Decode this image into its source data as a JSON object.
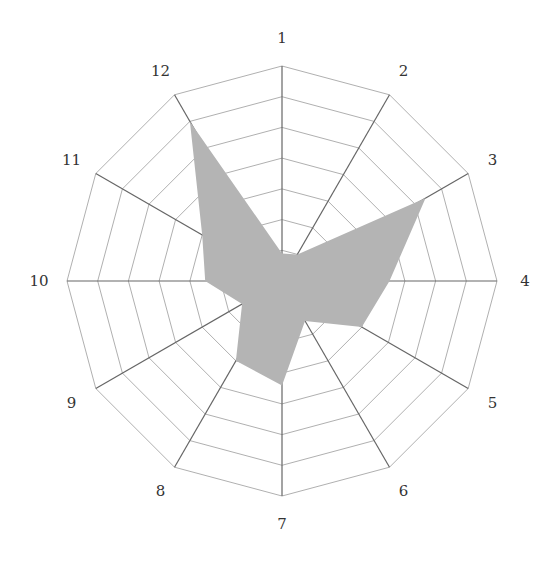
{
  "chart_data": {
    "type": "radar",
    "title": "",
    "categories": [
      "1",
      "2",
      "3",
      "4",
      "5",
      "6",
      "7",
      "8",
      "9",
      "10",
      "11",
      "12"
    ],
    "series": [
      {
        "name": "",
        "values": [
          0.9,
          1.0,
          5.4,
          3.5,
          3.0,
          1.5,
          3.4,
          3.0,
          1.5,
          2.5,
          3.0,
          6.0
        ]
      }
    ],
    "rlim": [
      0,
      7
    ],
    "rings": 7,
    "grid": true,
    "legend": "none",
    "fill_color": "#b4b4b4",
    "grid_color": "#b0b0b0",
    "axis_color": "#666666",
    "label_color": "#333333"
  }
}
